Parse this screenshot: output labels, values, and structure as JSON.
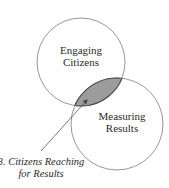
{
  "diagram": {
    "type": "venn",
    "circles": [
      {
        "id": "engaging-citizens",
        "label_lines": [
          "Engaging",
          "Citizens"
        ],
        "cx": 81,
        "cy": 62,
        "r": 44
      },
      {
        "id": "measuring-results",
        "label_lines": [
          "Measuring",
          "Results"
        ],
        "cx": 117,
        "cy": 124,
        "r": 46
      }
    ],
    "intersection": {
      "fill": "#9c9c9c",
      "callout_lines": [
        "3. Citizens Reaching",
        "for Results"
      ]
    },
    "colors": {
      "circle_stroke": "#8a8a8a",
      "intersection_stroke": "#4a4a4a",
      "text": "#2a2a2a",
      "arrow": "#555555"
    }
  }
}
